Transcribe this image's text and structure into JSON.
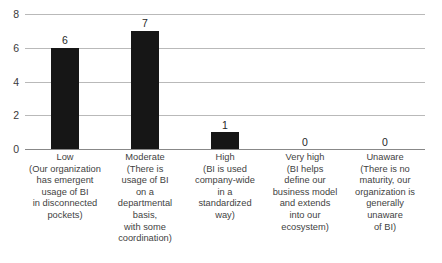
{
  "chart_data": {
    "type": "bar",
    "title": "",
    "subtitle": "",
    "xlabel": "",
    "ylabel": "",
    "ylim": [
      0,
      8
    ],
    "yticks": [
      0,
      2,
      4,
      6,
      8
    ],
    "grid": true,
    "legend": false,
    "orientation": "vertical",
    "bar_color": "#161616",
    "gridline_color": "#b9b9b9",
    "axis_color": "#888888",
    "background_color": "#ffffff",
    "text_color": "#3f3f3f",
    "categories": [
      "Low\n(Our organization\nhas emergent\nusage of BI\nin disconnected\npockets)",
      "Moderate\n(There is\nusage of BI\non a\ndepartmental\nbasis,\nwith some\ncoordination)",
      "High\n(BI is used\ncompany-wide\nin a\nstandardized\nway)",
      "Very high\n(BI helps\ndefine our\nbusiness model\nand extends\ninto our\necosystem)",
      "Unaware\n(There is no\nmaturity, our\norganization is\ngenerally\nunaware\nof BI)"
    ],
    "category_short_names": [
      "Low",
      "Moderate",
      "High",
      "Very high",
      "Unaware"
    ],
    "values": [
      6,
      7,
      1,
      0,
      0
    ],
    "value_labels": [
      "6",
      "7",
      "1",
      "0",
      "0"
    ],
    "ytick_labels": [
      "0",
      "2",
      "4",
      "6",
      "8"
    ]
  }
}
